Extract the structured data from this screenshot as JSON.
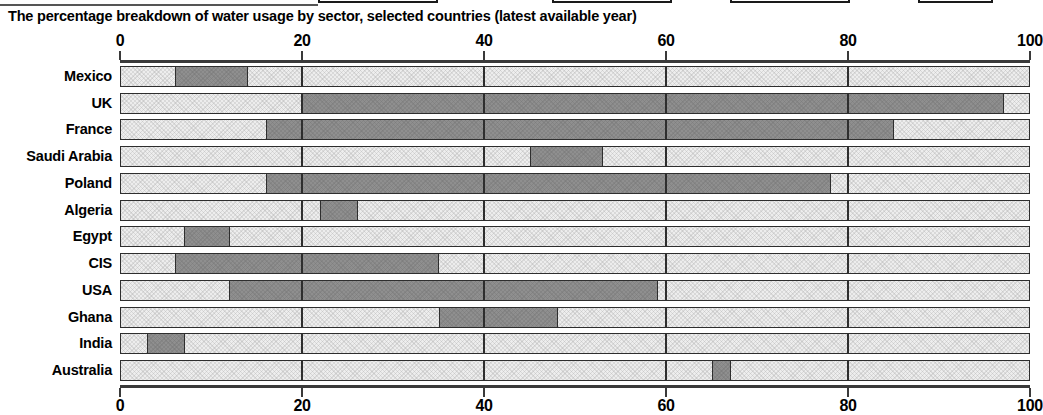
{
  "chart_title": "The percentage breakdown of water usage by sector, selected countries (latest available year)",
  "legend": {
    "note": "partially cropped legend swatches along the top edge",
    "entries": [
      {
        "name": "legend-swatch-1",
        "left": 318,
        "width": 120
      },
      {
        "name": "legend-swatch-2",
        "left": 552,
        "width": 120
      },
      {
        "name": "legend-swatch-3",
        "left": 730,
        "width": 120
      },
      {
        "name": "legend-swatch-4",
        "left": 918,
        "width": 75
      }
    ]
  },
  "axis": {
    "ticks": [
      0,
      20,
      40,
      60,
      80,
      100
    ],
    "tick_labels": [
      "0",
      "20",
      "40",
      "60",
      "80",
      "100"
    ],
    "min": 0,
    "max": 100
  },
  "colors": {
    "domestic": "#ededed",
    "industry": "#8f8f8f",
    "agriculture": "#ededed",
    "outline": "#2e2e2e",
    "axis": "#3a3a3a",
    "background": "#ffffff"
  },
  "chart_data": {
    "type": "bar",
    "orientation": "horizontal",
    "stacked": true,
    "normalized_percent": true,
    "title": "The percentage breakdown of water usage by sector, selected countries (latest available year)",
    "xlabel": "",
    "ylabel": "",
    "xlim": [
      0,
      100
    ],
    "grid": true,
    "legend_position": "top",
    "categories": [
      "Mexico",
      "UK",
      "France",
      "Saudi Arabia",
      "Poland",
      "Algeria",
      "Egypt",
      "CIS",
      "USA",
      "Ghana",
      "India",
      "Australia"
    ],
    "series": [
      {
        "name": "Domestic",
        "values": [
          6,
          20,
          16,
          45,
          16,
          22,
          7,
          6,
          12,
          35,
          3,
          65
        ]
      },
      {
        "name": "Industry",
        "values": [
          8,
          77,
          69,
          8,
          62,
          4,
          5,
          29,
          47,
          13,
          4,
          2
        ]
      },
      {
        "name": "Agriculture",
        "values": [
          86,
          3,
          15,
          47,
          22,
          74,
          88,
          65,
          41,
          52,
          93,
          33
        ]
      }
    ],
    "cumulative_boundaries": [
      {
        "country": "Mexico",
        "seg1_end": 6,
        "seg2_end": 14
      },
      {
        "country": "UK",
        "seg1_end": 20,
        "seg2_end": 97
      },
      {
        "country": "France",
        "seg1_end": 16,
        "seg2_end": 85
      },
      {
        "country": "Saudi Arabia",
        "seg1_end": 45,
        "seg2_end": 53
      },
      {
        "country": "Poland",
        "seg1_end": 16,
        "seg2_end": 78
      },
      {
        "country": "Algeria",
        "seg1_end": 22,
        "seg2_end": 26
      },
      {
        "country": "Egypt",
        "seg1_end": 7,
        "seg2_end": 12
      },
      {
        "country": "CIS",
        "seg1_end": 6,
        "seg2_end": 35
      },
      {
        "country": "USA",
        "seg1_end": 12,
        "seg2_end": 59
      },
      {
        "country": "Ghana",
        "seg1_end": 35,
        "seg2_end": 48
      },
      {
        "country": "India",
        "seg1_end": 3,
        "seg2_end": 7
      },
      {
        "country": "Australia",
        "seg1_end": 65,
        "seg2_end": 67
      }
    ]
  }
}
